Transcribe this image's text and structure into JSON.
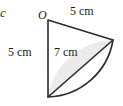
{
  "figure": {
    "type": "geometry-diagram",
    "part_letter": "c",
    "vertex_label": "O",
    "labels": {
      "top_side": "5 cm",
      "left_side": "5 cm",
      "chord": "7 cm"
    },
    "measurements": [
      {
        "name": "top-radius",
        "value": 5,
        "unit": "cm",
        "text": "5 cm"
      },
      {
        "name": "left-radius",
        "value": 5,
        "unit": "cm",
        "text": "5 cm"
      },
      {
        "name": "chord",
        "value": 7,
        "unit": "cm",
        "text": "7 cm"
      }
    ],
    "colors": {
      "stroke": "#2b2b2b",
      "shaded_fill": "#eceaea",
      "background": "#ffffff",
      "text": "#1b1b1b"
    },
    "geometry": {
      "centre": {
        "x": 48,
        "y": 20
      },
      "arc_start": {
        "x": 113,
        "y": 40
      },
      "arc_end": {
        "x": 48,
        "y": 97
      },
      "radius_px": 68,
      "sector_path": "M 48 20 L 113 40 A 68 68 0 0 1 48 97 Z",
      "segment_path": "M 48 97 L 113 40 A 68 68 0 0 0 48 97 Z",
      "chord_line": {
        "x1": 48,
        "y1": 97,
        "x2": 113,
        "y2": 40
      }
    }
  }
}
